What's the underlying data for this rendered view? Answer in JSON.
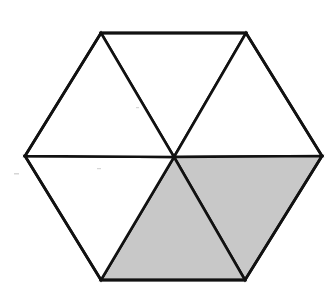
{
  "diagram": {
    "shape": "regular hexagon",
    "divided_into": 6,
    "piece_shape": "equilateral triangle",
    "shaded_count": 2,
    "total_count": 6,
    "shaded_fraction": "2/6",
    "colors": {
      "background": "#ffffff",
      "stroke": "#111111",
      "unshaded_fill": "#ffffff",
      "shaded_fill": "#c8c8c8"
    },
    "center": [
      174,
      157
    ],
    "vertices": {
      "top_left": [
        101,
        33
      ],
      "top_right": [
        246,
        33
      ],
      "right": [
        322,
        156
      ],
      "bottom_right": [
        245,
        280
      ],
      "bottom_left": [
        101,
        280
      ],
      "left": [
        25,
        156
      ]
    },
    "triangles": [
      {
        "id": "top",
        "shaded": false
      },
      {
        "id": "upper-right",
        "shaded": false
      },
      {
        "id": "lower-right",
        "shaded": true
      },
      {
        "id": "bottom",
        "shaded": true
      },
      {
        "id": "lower-left",
        "shaded": false
      },
      {
        "id": "upper-left",
        "shaded": false
      }
    ]
  }
}
